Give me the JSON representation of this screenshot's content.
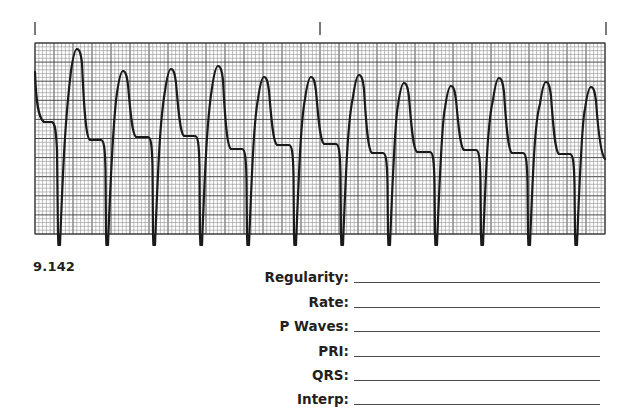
{
  "figure": {
    "number": "9.142",
    "type": "ECG rhythm strip (single lead)"
  },
  "strip": {
    "time_marks": [
      35,
      320,
      606
    ],
    "grid": {
      "left": 35,
      "top": 43,
      "right": 605,
      "bottom": 234,
      "minor_px": 3.8,
      "major_every": 5,
      "minor_color": "#8a8a8a",
      "major_color": "#3a3a3a"
    },
    "trace_color": "#1a1a1a",
    "beats": [
      {
        "spike_x": 58,
        "peak_x": 77,
        "peak_y": 49,
        "shoulder_y": 123
      },
      {
        "spike_x": 106,
        "peak_x": 123,
        "peak_y": 71,
        "shoulder_y": 140
      },
      {
        "spike_x": 153,
        "peak_x": 171,
        "peak_y": 69,
        "shoulder_y": 137
      },
      {
        "spike_x": 200,
        "peak_x": 218,
        "peak_y": 66,
        "shoulder_y": 136
      },
      {
        "spike_x": 247,
        "peak_x": 264,
        "peak_y": 77,
        "shoulder_y": 149
      },
      {
        "spike_x": 294,
        "peak_x": 311,
        "peak_y": 77,
        "shoulder_y": 145
      },
      {
        "spike_x": 341,
        "peak_x": 359,
        "peak_y": 75,
        "shoulder_y": 144
      },
      {
        "spike_x": 388,
        "peak_x": 404,
        "peak_y": 83,
        "shoulder_y": 153
      },
      {
        "spike_x": 435,
        "peak_x": 451,
        "peak_y": 86,
        "shoulder_y": 152
      },
      {
        "spike_x": 481,
        "peak_x": 499,
        "peak_y": 78,
        "shoulder_y": 150
      },
      {
        "spike_x": 528,
        "peak_x": 546,
        "peak_y": 82,
        "shoulder_y": 153
      },
      {
        "spike_x": 575,
        "peak_x": 591,
        "peak_y": 87,
        "shoulder_y": 154
      }
    ],
    "end": {
      "x": 605,
      "y": 159
    }
  },
  "worksheet": {
    "fields": [
      {
        "label": "Regularity:",
        "value": ""
      },
      {
        "label": "Rate:",
        "value": ""
      },
      {
        "label": "P Waves:",
        "value": ""
      },
      {
        "label": "PRI:",
        "value": ""
      },
      {
        "label": "QRS:",
        "value": ""
      },
      {
        "label": "Interp:",
        "value": ""
      }
    ]
  }
}
